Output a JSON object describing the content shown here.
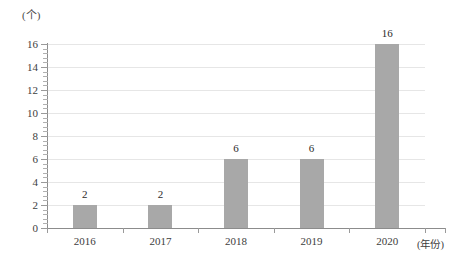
{
  "chart_data": {
    "type": "bar",
    "title": "",
    "subtitle": "",
    "categories": [
      "2016",
      "2017",
      "2018",
      "2019",
      "2020"
    ],
    "values": [
      2,
      2,
      6,
      6,
      16
    ],
    "series": [
      {
        "name": "",
        "values": [
          2,
          2,
          6,
          6,
          16
        ]
      }
    ],
    "xlabel": "(年份)",
    "ylabel": "(个)",
    "ylim": [
      0,
      16
    ],
    "y_major_step": 2,
    "y_minor_step": 0.4,
    "y_ticks": [
      "0",
      "2",
      "4",
      "6",
      "8",
      "10",
      "12",
      "14",
      "16"
    ],
    "data_labels": [
      "2",
      "2",
      "6",
      "6",
      "16"
    ],
    "grid": true,
    "grid_axis": "y",
    "legend": false,
    "legend_position": "none",
    "annotations": [],
    "colors": {
      "bar": "#a8a8a8",
      "gridline": "#e6e6e6",
      "axis": "#8c8c8c",
      "tick": "#9a9a9a",
      "text": "#3d3d3d",
      "background": "#ffffff"
    }
  }
}
